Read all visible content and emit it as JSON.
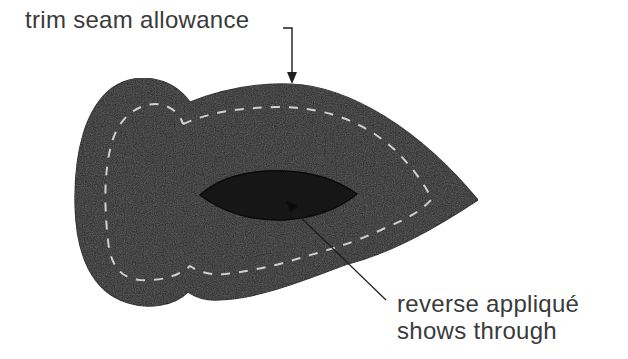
{
  "diagram": {
    "title": "",
    "labels": {
      "trim_seam_allowance": "trim seam allowance",
      "reverse_applique_line1": "reverse appliqué",
      "reverse_applique_line2": "shows through"
    },
    "colors": {
      "fabric": "#262626",
      "fabric_outline": "#111111",
      "inner_window": "#161616",
      "stitch_line": "#d0d0d0",
      "arrow": "#1e1e1e",
      "text": "#3a3a3a",
      "background": "#ffffff"
    },
    "elements": [
      {
        "id": "applique-shape",
        "description": "dark fabric appliqué piece with lobed left side and pointed right tip"
      },
      {
        "id": "seam-line",
        "description": "dashed light stitching line inset from the outer edge"
      },
      {
        "id": "reverse-window",
        "description": "lens-shaped cut-out where the reverse appliqué fabric shows through"
      },
      {
        "id": "trim-arrow",
        "description": "arrow from 'trim seam allowance' label pointing down to top edge"
      },
      {
        "id": "leader-line",
        "description": "line from the reverse window to the 'reverse appliqué shows through' label"
      }
    ]
  }
}
